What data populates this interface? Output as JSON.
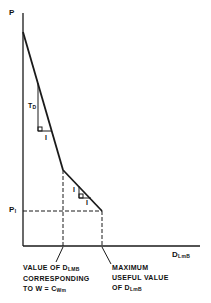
{
  "diagram": {
    "y_axis_label": "P",
    "x_axis_label_main": "D",
    "x_axis_label_sub": "LmB",
    "p_level_label_main": "P",
    "p_level_label_sub": "I",
    "slope1_vertical_label_main": "T",
    "slope1_vertical_label_sub": "D",
    "slope1_horizontal_label": "I",
    "slope2_vertical_label": "I",
    "slope2_horizontal_label": "I",
    "annotation_left": {
      "line1_main": "VALUE OF D",
      "line1_sub": "LMB",
      "line2": "CORRESPONDING",
      "line3_main": "TO W = C",
      "line3_sub": "Wm"
    },
    "annotation_right": {
      "line1": "MAXIMUM",
      "line2": "USEFUL VALUE",
      "line3_main": "OF D",
      "line3_sub": "LmB"
    },
    "colors": {
      "line": "#1a1a1a",
      "background": "#ffffff"
    }
  }
}
